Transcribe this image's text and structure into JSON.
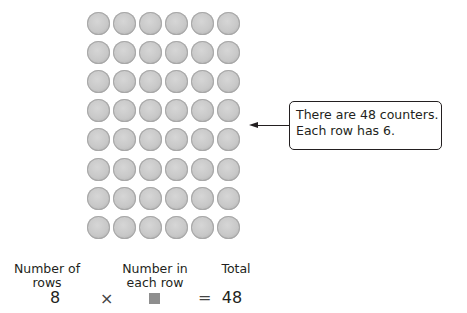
{
  "array": {
    "rows": 8,
    "columns": 6,
    "counter_color": "#c8c8c8"
  },
  "callout": {
    "line1": "There are 48 counters.",
    "line2": "Each row has 6."
  },
  "equation": {
    "labels": {
      "rows_line1": "Number of",
      "rows_line2": "rows",
      "each_line1": "Number in",
      "each_line2": "each row",
      "total": "Total"
    },
    "rows_value": "8",
    "times_symbol": "×",
    "unknown": "■",
    "equals_symbol": "=",
    "total_value": "48"
  }
}
